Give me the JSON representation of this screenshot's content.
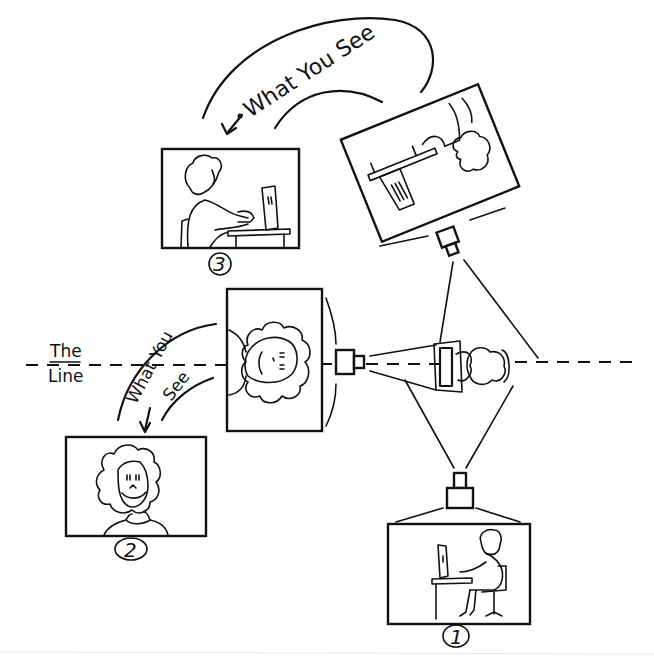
{
  "diagram": {
    "line_label": {
      "line1": "The",
      "line2": "Line"
    },
    "top_arc_label": "What You See",
    "left_arc_label_1": "What You",
    "left_arc_label_2": "See",
    "shots": [
      {
        "number": "1",
        "description": "Side view of person seated at computer desk (camera 1, below the line)"
      },
      {
        "number": "2",
        "description": "Front close-up of face (camera on the line)"
      },
      {
        "number": "3",
        "description": "Side view of person at computer (camera 3, over the line)"
      }
    ],
    "colors": {
      "ink": "#111111",
      "paper": "#ffffff"
    }
  }
}
